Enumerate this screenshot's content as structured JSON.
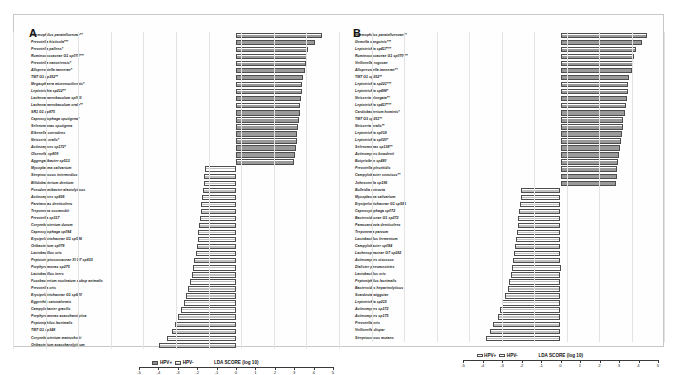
{
  "figure": {
    "panels": [
      {
        "letter": "A",
        "axis_title": "LDA SCORE (log 10)",
        "legend": [
          {
            "label": "HPV+",
            "style": "pos"
          },
          {
            "label": "HPV-",
            "style": "neg"
          }
        ]
      },
      {
        "letter": "B",
        "axis_title": "LDA SCORE (log 10)",
        "legend": [
          {
            "label": "HPV+",
            "style": "pos"
          },
          {
            "label": "HPV-",
            "style": "neg"
          }
        ]
      }
    ]
  },
  "chart_data": [
    {
      "type": "bar",
      "orientation": "horizontal",
      "title": "A",
      "xlabel": "LDA SCORE (log 10)",
      "ylabel": "",
      "xlim": [
        -5,
        5
      ],
      "xticks": [
        -5,
        -4,
        -3,
        -2,
        -1,
        0,
        1,
        2,
        3,
        4,
        5
      ],
      "grid": true,
      "legend": [
        "HPV+",
        "HPV-"
      ],
      "legend_position": "bottom-left",
      "categories": [
        "Haemophilus parainfluenzae**",
        "Prevotella histicola***",
        "Prevotella pallens*",
        "Ruminococcaceae G1 sp078***",
        "Prevotella nanceiensis*",
        "Alloprevotella tannerae*",
        "TM7 G1 sp352**",
        "Megasphaera micronuciformis*",
        "Leptotrichia sp212**",
        "Lachnoanaerobaculum sp083",
        "Lachnoanaerobaculum orale**",
        "SR1 G1 sp875",
        "Capnocytophaga sputigena*",
        "Selenomonas sputigena",
        "Eikenella corrodens",
        "Neisseria oralis*",
        "Actinomyces sp172*",
        "Olsenella sp809",
        "Aggregatibacter sp513",
        "Mycoplasma salivarium",
        "Streptococcus intermedius",
        "Bifidobacterium dentium",
        "Pseudoramibacter alactolyticus",
        "Actinomyces sp826",
        "Parvimonas denticolens",
        "Treponema socranskii",
        "Prevotella sp317",
        "Corynebacterium durum",
        "Capnocytophaga sp084",
        "Erysipelotrichaceae G1 sp586",
        "Oribacterium sp078",
        "Lactobacillus oris",
        "Peptostreptococcaceae XI G7 sp833",
        "Porphyromonas sp275",
        "Lactobacillus iners",
        "Fusobacterium nucleatum subsp animalis",
        "Prevotella oris",
        "Erysipelotrichaceae G1 sp600",
        "Eggerthia catonaformis",
        "Campylobacter gracilis",
        "Porphyromonas asaccharolytica",
        "Peptoniphilus lacrimalis",
        "TM7 G1 sp348",
        "Corynebacterium matruchotii",
        "Oribacterium asaccharolyticum"
      ],
      "values": [
        4.42,
        4.05,
        3.73,
        3.66,
        3.62,
        3.58,
        3.45,
        3.42,
        3.38,
        3.35,
        3.32,
        3.28,
        3.25,
        3.2,
        3.16,
        3.12,
        3.08,
        3.05,
        3.0,
        -1.62,
        -1.64,
        -1.66,
        -1.7,
        -1.74,
        -1.78,
        -1.82,
        -1.86,
        -1.9,
        -1.94,
        -1.98,
        -2.02,
        -2.08,
        -2.14,
        -2.2,
        -2.28,
        -2.36,
        -2.46,
        -2.56,
        -2.68,
        -2.82,
        -2.98,
        -3.14,
        -3.3,
        -3.58,
        -3.95
      ],
      "value_groups": [
        "pos",
        "pos",
        "pos",
        "pos",
        "pos",
        "pos",
        "pos",
        "pos",
        "pos",
        "pos",
        "pos",
        "pos",
        "pos",
        "pos",
        "pos",
        "pos",
        "pos",
        "pos",
        "pos",
        "neg",
        "neg",
        "neg",
        "neg",
        "neg",
        "neg",
        "neg",
        "neg",
        "neg",
        "neg",
        "neg",
        "neg",
        "neg",
        "neg",
        "neg",
        "neg",
        "neg",
        "neg",
        "neg",
        "neg",
        "neg",
        "neg",
        "neg",
        "neg",
        "neg",
        "neg"
      ]
    },
    {
      "type": "bar",
      "orientation": "horizontal",
      "title": "B",
      "xlabel": "LDA SCORE (log 10)",
      "ylabel": "",
      "xlim": [
        -5,
        5
      ],
      "xticks": [
        -5,
        -4,
        -3,
        -2,
        -1,
        0,
        1,
        2,
        3,
        4,
        5
      ],
      "grid": true,
      "legend": [
        "HPV+",
        "HPV-"
      ],
      "legend_position": "bottom-left",
      "categories": [
        "Haemophilus parainfluenzae**",
        "Gemella sanguinis***",
        "Leptotrichia sp417***",
        "Ruminococcaceae G1 sp070***",
        "Veillonella rogosae",
        "Alloprevotella tannerae**",
        "TM7 G1 sp352**",
        "Leptotrichia sp221***",
        "Leptotrichia sp498*",
        "Neisseria elongata**",
        "Leptotrichia sp417***",
        "Cardiobacterium hominis*",
        "TM7 G3 sp351**",
        "Neisseria oralis**",
        "Leptotrichia sp018",
        "Leptotrichia sp020*",
        "Selenomonas sp138**",
        "Actinomyces bowdenii",
        "Butyrivibrio sp480",
        "Prevotella pleuritidis",
        "Campylobacter concisus**",
        "Johnsonella sp196",
        "Bulleidia extructa",
        "Mycoplasma salivarium",
        "Erysipelotrichaceae G1 sp586",
        "Capnocytophaga sp072",
        "Bacteroidaceae G1 sp272",
        "Parascardovia denticolens",
        "Treponema parvum",
        "Lactobacillus fermentum",
        "Campylobacter sp084",
        "Lachnospiraceae G7 sp182",
        "Actinomyces viscosus",
        "Dialister pneumosintes",
        "Lactobacillus oris",
        "Peptoniphilus lacrimalis",
        "Bacteroides heparinolyticus",
        "Scardovia wiggsiae",
        "Leptotrichia sp215",
        "Actinomyces sp172",
        "Actinomyces sp175",
        "Prevotella oris",
        "Veillonella dispar",
        "Streptococcus mutans"
      ],
      "values": [
        4.46,
        4.18,
        3.86,
        3.78,
        3.72,
        3.66,
        3.52,
        3.48,
        3.44,
        3.4,
        3.36,
        3.3,
        3.22,
        3.18,
        3.14,
        3.1,
        3.05,
        3.0,
        2.96,
        2.92,
        2.88,
        2.84,
        -2.02,
        -2.05,
        -2.08,
        -2.12,
        -2.16,
        -2.2,
        -2.24,
        -2.28,
        -2.32,
        -2.38,
        -2.44,
        -2.5,
        -2.56,
        -2.62,
        -2.7,
        -2.84,
        -2.98,
        -3.1,
        -3.22,
        -3.46,
        -3.64,
        -3.82
      ],
      "value_groups": [
        "pos",
        "pos",
        "pos",
        "pos",
        "pos",
        "pos",
        "pos",
        "pos",
        "pos",
        "pos",
        "pos",
        "pos",
        "pos",
        "pos",
        "pos",
        "pos",
        "pos",
        "pos",
        "pos",
        "pos",
        "pos",
        "pos",
        "neg",
        "neg",
        "neg",
        "neg",
        "neg",
        "neg",
        "neg",
        "neg",
        "neg",
        "neg",
        "neg",
        "neg",
        "neg",
        "neg",
        "neg",
        "neg",
        "neg",
        "neg",
        "neg",
        "neg",
        "neg",
        "neg"
      ]
    }
  ]
}
